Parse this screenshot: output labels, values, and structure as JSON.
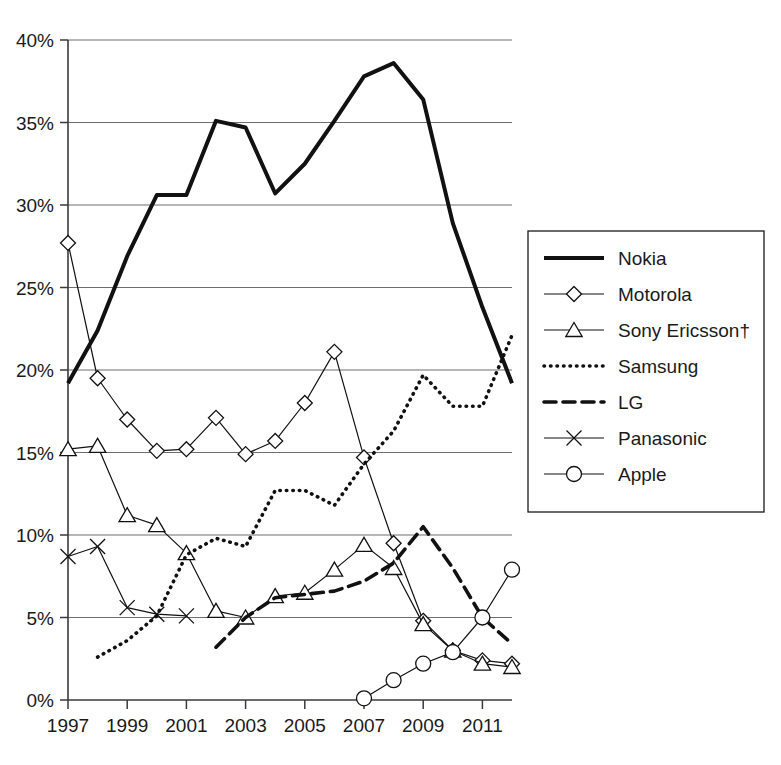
{
  "figure": {
    "top_cut_caption": "",
    "background_color": "#ffffff",
    "line_color": "#111111",
    "grid_color": "#6e6e6e"
  },
  "axes": {
    "y_ticks": [
      "0%",
      "5%",
      "10%",
      "15%",
      "20%",
      "25%",
      "30%",
      "35%",
      "40%"
    ],
    "x_ticks": [
      "1997",
      "1999",
      "2001",
      "2003",
      "2005",
      "2007",
      "2009",
      "2011"
    ]
  },
  "legend": {
    "items": [
      {
        "label": "Nokia",
        "style": "thick-solid",
        "marker": "none"
      },
      {
        "label": "Motorola",
        "style": "thin-solid",
        "marker": "diamond"
      },
      {
        "label": "Sony Ericsson†",
        "style": "thin-solid",
        "marker": "triangle"
      },
      {
        "label": "Samsung",
        "style": "dotted",
        "marker": "none"
      },
      {
        "label": "LG",
        "style": "dashed",
        "marker": "none"
      },
      {
        "label": "Panasonic",
        "style": "thin-solid",
        "marker": "cross"
      },
      {
        "label": "Apple",
        "style": "thin-solid",
        "marker": "circle"
      }
    ]
  },
  "chart_data": {
    "type": "line",
    "title": "",
    "xlabel": "",
    "ylabel": "",
    "xlim": [
      1997,
      2012
    ],
    "ylim": [
      0,
      40
    ],
    "ytick_values": [
      0,
      5,
      10,
      15,
      20,
      25,
      30,
      35,
      40
    ],
    "xtick_values": [
      1997,
      1999,
      2001,
      2003,
      2005,
      2007,
      2009,
      2011
    ],
    "grid": "horizontal",
    "legend_position": "right",
    "unit": "percent",
    "x": [
      1997,
      1998,
      1999,
      2000,
      2001,
      2002,
      2003,
      2004,
      2005,
      2006,
      2007,
      2008,
      2009,
      2010,
      2011,
      2012
    ],
    "series": [
      {
        "name": "Nokia",
        "style": "thick-solid",
        "marker": "none",
        "x": [
          1997,
          1998,
          1999,
          2000,
          2001,
          2002,
          2003,
          2004,
          2005,
          2006,
          2007,
          2008,
          2009,
          2010,
          2011,
          2012
        ],
        "values": [
          19.2,
          22.4,
          26.9,
          30.6,
          30.6,
          35.1,
          34.7,
          30.7,
          32.5,
          35.1,
          37.8,
          38.6,
          36.4,
          28.9,
          23.8,
          19.2
        ]
      },
      {
        "name": "Motorola",
        "style": "thin-solid",
        "marker": "diamond",
        "x": [
          1997,
          1998,
          1999,
          2000,
          2001,
          2002,
          2003,
          2004,
          2005,
          2006,
          2007,
          2008,
          2009,
          2010,
          2011,
          2012
        ],
        "values": [
          27.7,
          19.5,
          17.0,
          15.1,
          15.2,
          17.1,
          14.9,
          15.7,
          18.0,
          21.1,
          14.7,
          9.5,
          4.8,
          3.0,
          2.4,
          2.2
        ]
      },
      {
        "name": "Sony Ericsson†",
        "style": "thin-solid",
        "marker": "triangle",
        "x": [
          1997,
          1998,
          1999,
          2000,
          2001,
          2002,
          2003,
          2004,
          2005,
          2006,
          2007,
          2008,
          2009,
          2010,
          2011,
          2012
        ],
        "values": [
          15.2,
          15.4,
          11.2,
          10.6,
          8.9,
          5.4,
          5.0,
          6.3,
          6.5,
          7.9,
          9.4,
          8.0,
          4.6,
          3.0,
          2.2,
          2.0
        ]
      },
      {
        "name": "Samsung",
        "style": "dotted",
        "marker": "none",
        "x": [
          1998,
          1999,
          2000,
          2001,
          2002,
          2003,
          2004,
          2005,
          2006,
          2007,
          2008,
          2009,
          2010,
          2011,
          2012
        ],
        "values": [
          2.6,
          3.6,
          5.1,
          8.8,
          9.8,
          9.3,
          12.7,
          12.7,
          11.8,
          14.3,
          16.3,
          19.7,
          17.8,
          17.8,
          22.1
        ]
      },
      {
        "name": "LG",
        "style": "dashed",
        "marker": "none",
        "x": [
          2002,
          2003,
          2004,
          2005,
          2006,
          2007,
          2008,
          2009,
          2010,
          2011,
          2012
        ],
        "values": [
          3.2,
          5.0,
          6.2,
          6.4,
          6.6,
          7.2,
          8.3,
          10.5,
          8.0,
          5.0,
          3.4
        ]
      },
      {
        "name": "Panasonic",
        "style": "thin-solid",
        "marker": "cross",
        "x": [
          1997,
          1998,
          1999,
          2000,
          2001
        ],
        "values": [
          8.7,
          9.3,
          5.6,
          5.2,
          5.1
        ]
      },
      {
        "name": "Apple",
        "style": "thin-solid",
        "marker": "circle",
        "x": [
          2007,
          2008,
          2009,
          2010,
          2011,
          2012
        ],
        "values": [
          0.1,
          1.2,
          2.2,
          2.9,
          5.0,
          7.9
        ]
      }
    ]
  }
}
